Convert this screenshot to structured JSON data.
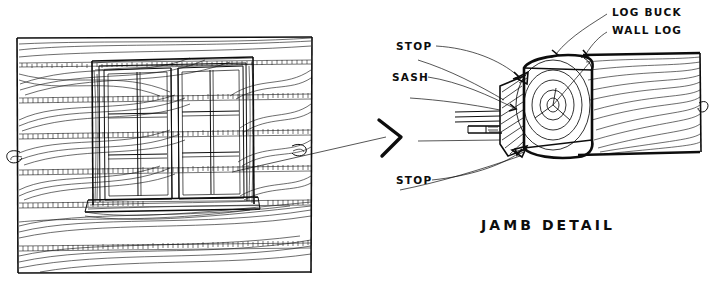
{
  "drawing": {
    "kind": "hand-drawn architectural plate",
    "medium_color": "#0d0d0d",
    "background_color": "#ffffff"
  },
  "elevation": {
    "name": "log wall window elevation",
    "border": {
      "x": 17,
      "y": 37,
      "w": 295,
      "h": 237
    },
    "window": {
      "sash_count": 2,
      "rows": 3,
      "cols": 2,
      "lites_per_sash": 6,
      "lites_total": 12
    },
    "log_courses": 6,
    "features": [
      "chinking",
      "wood-grain",
      "scribed log ends",
      "sill board",
      "log buck frame"
    ]
  },
  "detail": {
    "title": "JAMB DETAIL",
    "labels": [
      {
        "id": "stop-upper",
        "text": "STOP",
        "x": 398,
        "y": 46
      },
      {
        "id": "sash",
        "text": "SASH",
        "x": 394,
        "y": 77
      },
      {
        "id": "log-buck",
        "text": "LOG BUCK",
        "x": 613,
        "y": 12
      },
      {
        "id": "wall-log",
        "text": "WALL LOG",
        "x": 613,
        "y": 30
      },
      {
        "id": "stop-lower",
        "text": "STOP",
        "x": 398,
        "y": 180
      }
    ],
    "components": [
      "log buck",
      "wall log",
      "sash",
      "stop"
    ],
    "section_features": [
      "growth rings",
      "section hatching",
      "cut log end",
      "break line"
    ]
  },
  "pointer": {
    "name": "view arrow",
    "direction": "right",
    "x": 390,
    "y": 137
  }
}
